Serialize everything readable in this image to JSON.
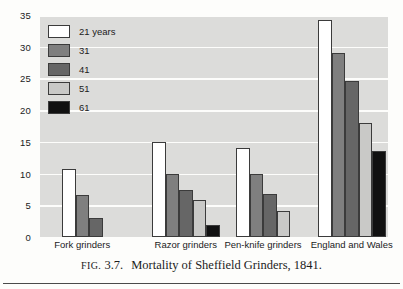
{
  "caption": {
    "fig_label": "FIG.",
    "fig_number": "3.7.",
    "text": "Mortality of Sheffield Grinders, 1841."
  },
  "legend": {
    "title": "",
    "items": [
      {
        "label": "21 years",
        "color": "#ffffff"
      },
      {
        "label": "31",
        "color": "#7f7f7f"
      },
      {
        "label": "41",
        "color": "#666666"
      },
      {
        "label": "51",
        "color": "#c9c9c7"
      },
      {
        "label": "61",
        "color": "#111111"
      }
    ]
  },
  "chart_data": {
    "type": "bar",
    "title": "Mortality of Sheffield Grinders, 1841.",
    "xlabel": "",
    "ylabel": "",
    "ylim": [
      0,
      35
    ],
    "yticks": [
      0,
      5,
      10,
      15,
      20,
      25,
      30,
      35
    ],
    "ytick_labels": [
      "0",
      "5",
      "10",
      "15",
      "20",
      "25",
      "30",
      "35"
    ],
    "grid": true,
    "legend_position": "upper-left inside plot",
    "categories": [
      "Fork grinders",
      "Razor grinders",
      "Pen-knife grinders",
      "England and Wales"
    ],
    "series": [
      {
        "name": "21 years",
        "color": "#ffffff",
        "values": [
          10.7,
          15.0,
          14.1,
          34.2
        ]
      },
      {
        "name": "31",
        "color": "#7f7f7f",
        "values": [
          6.7,
          9.9,
          9.9,
          29.0
        ]
      },
      {
        "name": "41",
        "color": "#666666",
        "values": [
          3.0,
          7.4,
          6.8,
          24.6
        ]
      },
      {
        "name": "51",
        "color": "#c9c9c7",
        "values": [
          null,
          5.8,
          4.1,
          18.0
        ]
      },
      {
        "name": "61",
        "color": "#111111",
        "values": [
          null,
          1.9,
          null,
          13.5
        ]
      }
    ]
  }
}
